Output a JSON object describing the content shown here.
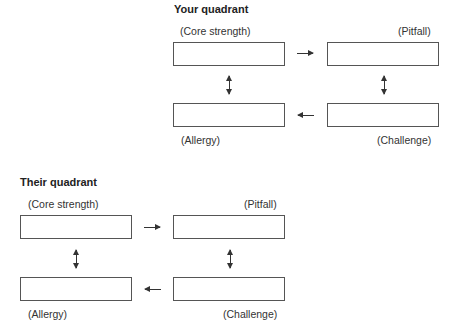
{
  "your_quadrant": {
    "title": "Your quadrant",
    "labels": {
      "core_strength": "(Core strength)",
      "pitfall": "(Pitfall)",
      "allergy": "(Allergy)",
      "challenge": "(Challenge)"
    },
    "boxes": {
      "core_strength": "",
      "pitfall": "",
      "allergy": "",
      "challenge": ""
    }
  },
  "their_quadrant": {
    "title": "Their quadrant",
    "labels": {
      "core_strength": "(Core strength)",
      "pitfall": "(Pitfall)",
      "allergy": "(Allergy)",
      "challenge": "(Challenge)"
    },
    "boxes": {
      "core_strength": "",
      "pitfall": "",
      "allergy": "",
      "challenge": ""
    }
  }
}
